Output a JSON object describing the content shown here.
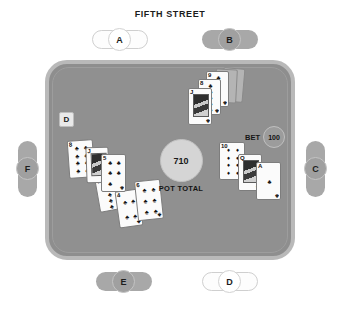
{
  "board": {
    "title": "FIFTH STREET"
  },
  "pot": {
    "amount": "710",
    "label": "POT TOTAL"
  },
  "bet": {
    "label": "BET",
    "amount": "100"
  },
  "dealer_button": {
    "label": "D"
  },
  "seats": [
    {
      "id": "a",
      "label": "A",
      "state": "inactive",
      "orientation": "horizontal"
    },
    {
      "id": "b",
      "label": "B",
      "state": "active",
      "orientation": "horizontal"
    },
    {
      "id": "c",
      "label": "C",
      "state": "active",
      "orientation": "vertical"
    },
    {
      "id": "d",
      "label": "D",
      "state": "inactive",
      "orientation": "horizontal"
    },
    {
      "id": "e",
      "label": "E",
      "state": "active",
      "orientation": "horizontal"
    },
    {
      "id": "f",
      "label": "F",
      "state": "active",
      "orientation": "vertical"
    }
  ],
  "card_groups": {
    "seat_b": {
      "cards": [
        {
          "rank": "",
          "suit": "",
          "face_down": true
        },
        {
          "rank": "",
          "suit": "",
          "face_down": true
        },
        {
          "rank": "9",
          "suit": "♣",
          "face_down": false
        },
        {
          "rank": "8",
          "suit": "♣",
          "face_down": false
        },
        {
          "rank": "J",
          "suit": "♣",
          "face_down": false
        }
      ]
    },
    "seat_c": {
      "cards": [
        {
          "rank": "10",
          "suit": "♦",
          "face_down": false
        },
        {
          "rank": "Q",
          "suit": "♣",
          "face_down": false
        },
        {
          "rank": "A",
          "suit": "♣",
          "face_down": false
        }
      ]
    },
    "seat_e": {
      "cards": [
        {
          "rank": "7",
          "suit": "♣",
          "face_down": false
        },
        {
          "rank": "4",
          "suit": "♣",
          "face_down": false
        },
        {
          "rank": "6",
          "suit": "♣",
          "face_down": false
        }
      ]
    },
    "seat_f": {
      "cards": [
        {
          "rank": "8",
          "suit": "♣",
          "face_down": false
        },
        {
          "rank": "J",
          "suit": "♣",
          "face_down": false
        },
        {
          "rank": "5",
          "suit": "♣",
          "face_down": false
        }
      ]
    }
  },
  "colors": {
    "table_felt": "#909090",
    "table_rail": "#b9b9b9",
    "seat_active": "#a8a8a8",
    "seat_inactive": "#fdfdfd",
    "pot_chip": "#d5d5d5",
    "bet_chip": "#9c9c9c",
    "text": "#1c1c1c",
    "page_background": "#ffffff"
  }
}
